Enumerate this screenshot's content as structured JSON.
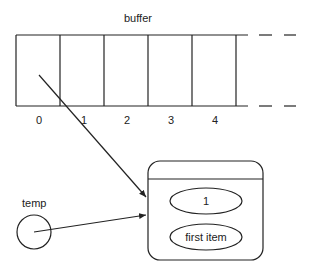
{
  "diagram": {
    "buffer_label": "buffer",
    "indices": [
      "0",
      "1",
      "2",
      "3",
      "4"
    ],
    "temp_label": "temp",
    "object_fields": [
      "1",
      "first item"
    ],
    "colors": {
      "stroke": "#222222",
      "background": "#ffffff"
    }
  }
}
